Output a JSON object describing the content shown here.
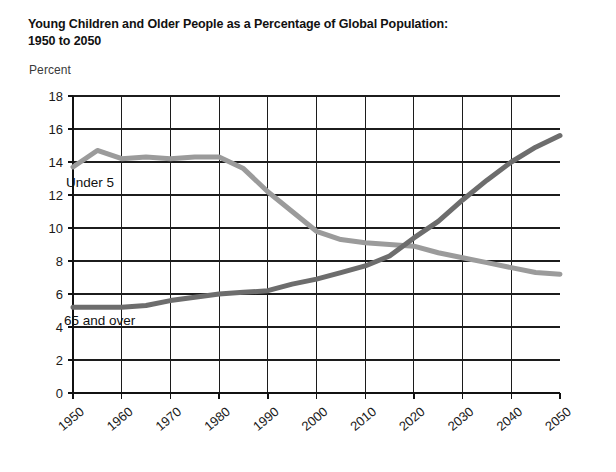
{
  "title": {
    "line1": "Young Children and Older People as a Percentage of Global Population:",
    "line2": "1950 to 2050"
  },
  "axis_unit_label": "Percent",
  "annotations": {
    "under5_label": "Under 5",
    "over65_label": "65 and over"
  },
  "colors": {
    "under5": "#9b9b9b",
    "over65": "#6d6d6d",
    "grid": "#1c1c1c",
    "axis": "#111111",
    "text": "#111111",
    "background": "#ffffff"
  },
  "chart_data": {
    "type": "line",
    "title": "Young Children and Older People as a Percentage of Global Population: 1950 to 2050",
    "xlabel": "",
    "ylabel": "Percent",
    "xlim": [
      1950,
      2050
    ],
    "ylim": [
      0,
      18
    ],
    "ytick_labels": [
      "0",
      "2",
      "4",
      "6",
      "8",
      "10",
      "12",
      "14",
      "16",
      "18"
    ],
    "yticks": [
      0,
      2,
      4,
      6,
      8,
      10,
      12,
      14,
      16,
      18
    ],
    "xtick_labels": [
      "1950",
      "1960",
      "1970",
      "1980",
      "1990",
      "2000",
      "2010",
      "2020",
      "2030",
      "2040",
      "2050"
    ],
    "xticks": [
      1950,
      1960,
      1970,
      1980,
      1990,
      2000,
      2010,
      2020,
      2030,
      2040,
      2050
    ],
    "grid": true,
    "legend_position": "inline-annotation",
    "x": [
      1950,
      1955,
      1960,
      1965,
      1970,
      1975,
      1980,
      1985,
      1990,
      1995,
      2000,
      2005,
      2010,
      2015,
      2020,
      2025,
      2030,
      2035,
      2040,
      2045,
      2050
    ],
    "series": [
      {
        "name": "Under 5",
        "color": "#9b9b9b",
        "values": [
          13.7,
          14.7,
          14.2,
          14.3,
          14.2,
          14.3,
          14.3,
          13.6,
          12.2,
          11.0,
          9.8,
          9.3,
          9.1,
          9.0,
          8.9,
          8.5,
          8.2,
          7.9,
          7.6,
          7.3,
          7.2
        ]
      },
      {
        "name": "65 and over",
        "color": "#6d6d6d",
        "values": [
          5.2,
          5.2,
          5.2,
          5.3,
          5.6,
          5.8,
          6.0,
          6.1,
          6.2,
          6.6,
          6.9,
          7.3,
          7.7,
          8.3,
          9.4,
          10.4,
          11.7,
          12.9,
          14.0,
          14.9,
          15.6
        ]
      }
    ]
  }
}
